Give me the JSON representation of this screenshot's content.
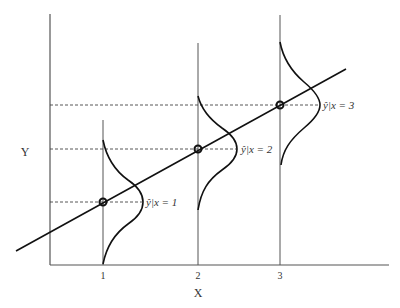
{
  "diagram": {
    "type": "regression-conditional-distributions",
    "x_axis_label": "X",
    "y_axis_label": "Y",
    "x_ticks": [
      "1",
      "2",
      "3"
    ],
    "points": [
      {
        "x": "1",
        "label_hat": "ŷ",
        "label_rest": "|x = 1"
      },
      {
        "x": "2",
        "label_hat": "ŷ",
        "label_rest": "|x = 2"
      },
      {
        "x": "3",
        "label_hat": "ŷ",
        "label_rest": "|x = 3"
      }
    ],
    "colors": {
      "line": "#111111",
      "axis": "#555555",
      "dashed": "#444444",
      "text": "#333333"
    }
  }
}
